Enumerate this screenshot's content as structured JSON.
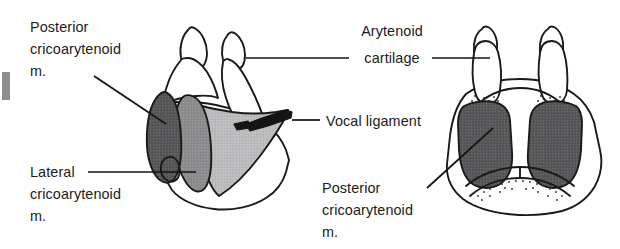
{
  "figure": {
    "width": 620,
    "height": 249,
    "background": "#ffffff"
  },
  "labels": {
    "posterior_cricoarytenoid_left": {
      "name": "Posterior cricoarytenoid m.",
      "line1": "Posterior",
      "line2": "cricoarytenoid",
      "line3": "m."
    },
    "lateral_cricoarytenoid": {
      "name": "Lateral cricoarytenoid m.",
      "line1": "Lateral",
      "line2": "cricoarytenoid",
      "line3": "m."
    },
    "arytenoid_cartilage": {
      "name": "Arytenoid cartilage",
      "line1": "Arytenoid",
      "line2": "cartilage"
    },
    "vocal_ligament": {
      "name": "Vocal ligament",
      "line1": "Vocal ligament"
    },
    "posterior_cricoarytenoid_right": {
      "name": "Posterior cricoarytenoid m.",
      "line1": "Posterior",
      "line2": "cricoarytenoid",
      "line3": "m."
    }
  },
  "colors": {
    "ink": "#1a1a1a",
    "text": "#1b1b1b",
    "muscle_dark": "#58585a",
    "muscle_mid": "#8d8d8f",
    "muscle_light": "#b9b9bb",
    "ligament": "#141414",
    "paper": "#ffffff",
    "edge_artifact": "#8e8e8e"
  },
  "views": {
    "left": {
      "name": "lateral-oblique-view",
      "structures": [
        "arytenoid-cartilage-near",
        "arytenoid-cartilage-far",
        "posterior-cricoarytenoid-muscle",
        "lateral-cricoarytenoid-muscle",
        "thyroarytenoid-region",
        "vocal-ligament",
        "cricoid-cartilage"
      ]
    },
    "right": {
      "name": "posterior-view",
      "structures": [
        "arytenoid-cartilage-left",
        "arytenoid-cartilage-right",
        "posterior-cricoarytenoid-muscle-left",
        "posterior-cricoarytenoid-muscle-right",
        "cricoid-lamina"
      ]
    }
  }
}
